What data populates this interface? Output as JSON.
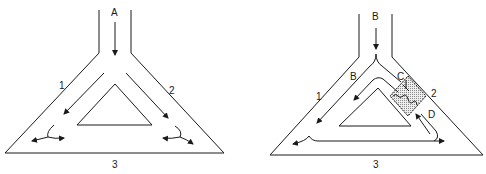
{
  "panels": [
    {
      "id": "left",
      "inlet_label": "A",
      "branch_left_label": "1",
      "branch_right_label": "2",
      "base_label": "3"
    },
    {
      "id": "right",
      "inlet_label": "B",
      "inner_flow_label": "B",
      "branch_left_label": "1",
      "branch_right_label": "2",
      "base_label": "3",
      "marker_c_label": "C",
      "marker_d_label": "D"
    }
  ],
  "colors": {
    "line": "#1a1a1a",
    "shade": "#c8c8c8"
  }
}
